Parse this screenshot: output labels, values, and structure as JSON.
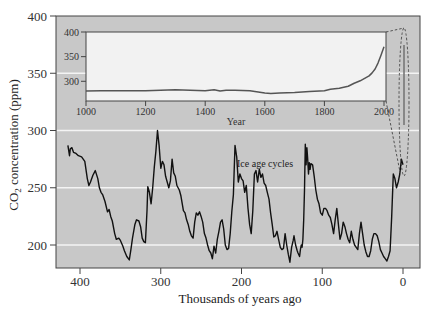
{
  "chart_data": [
    {
      "id": "main",
      "type": "line",
      "title": "",
      "xlabel": "Thousands of years ago",
      "ylabel": "CO2 concentration (ppm)",
      "ylabel_main": "CO",
      "ylabel_sub": "2",
      "ylabel_rest": " concentration (ppm)",
      "xlim": [
        420,
        -15
      ],
      "ylim": [
        180,
        400
      ],
      "x_reversed": true,
      "x_ticks": [
        400,
        300,
        200,
        100,
        0
      ],
      "x_tick_labels": [
        "400",
        "300",
        "200",
        "100",
        "0"
      ],
      "y_ticks": [
        200,
        250,
        300,
        350,
        400
      ],
      "y_tick_labels": [
        "200",
        "250",
        "300",
        "350",
        "400"
      ],
      "grid": "horizontal white lines at 200, 250, 300, 350",
      "background": "#c8c8c8",
      "annotation": "Ice age cycles",
      "series": [
        {
          "name": "Ice core CO2",
          "color": "#111111",
          "x": [
            415,
            413,
            412,
            410,
            408,
            405,
            402,
            398,
            394,
            391,
            389,
            387,
            384,
            381,
            378,
            376,
            374,
            372,
            369,
            366,
            364,
            362,
            360,
            357,
            355,
            352,
            350,
            347,
            345,
            342,
            339,
            337,
            335,
            332,
            330,
            327,
            325,
            323,
            321,
            319,
            317,
            316,
            314,
            312,
            310,
            308,
            306,
            304,
            302,
            300,
            298,
            296,
            294,
            292,
            290,
            288,
            286,
            284,
            282,
            280,
            277,
            275,
            272,
            270,
            268,
            266,
            264,
            262,
            260,
            258,
            256,
            254,
            252,
            250,
            248,
            246,
            244,
            242,
            240,
            238,
            236,
            234,
            232,
            230,
            228,
            226,
            224,
            222,
            220,
            218,
            216,
            214,
            212,
            210,
            208,
            206,
            204,
            202,
            200,
            198,
            196,
            194,
            192,
            190,
            188,
            186,
            184,
            182,
            180,
            178,
            176,
            174,
            172,
            170,
            168,
            166,
            164,
            162,
            160,
            158,
            156,
            154,
            152,
            150,
            148,
            146,
            144,
            142,
            140,
            138,
            136,
            135,
            133,
            131,
            130,
            128,
            127,
            126,
            125,
            124,
            123,
            122,
            121,
            120,
            119,
            118,
            117,
            116,
            115,
            114,
            112,
            110,
            108,
            106,
            104,
            102,
            100,
            98,
            96,
            94,
            92,
            90,
            88,
            86,
            84,
            82,
            80,
            78,
            76,
            74,
            72,
            70,
            68,
            66,
            64,
            62,
            60,
            58,
            56,
            54,
            52,
            50,
            48,
            46,
            44,
            42,
            40,
            38,
            36,
            34,
            32,
            30,
            28,
            26,
            24,
            22,
            20,
            18,
            16,
            14,
            12,
            10,
            8,
            6,
            4,
            2,
            0
          ],
          "y": [
            287,
            278,
            284,
            285,
            281,
            280,
            278,
            277,
            273,
            258,
            252,
            255,
            261,
            265,
            258,
            250,
            246,
            244,
            238,
            229,
            231,
            225,
            221,
            210,
            205,
            206,
            204,
            199,
            195,
            190,
            187,
            196,
            206,
            218,
            222,
            221,
            216,
            206,
            203,
            202,
            230,
            251,
            246,
            236,
            250,
            268,
            282,
            300,
            287,
            267,
            273,
            270,
            260,
            255,
            250,
            256,
            275,
            263,
            260,
            252,
            248,
            243,
            230,
            228,
            222,
            218,
            212,
            208,
            206,
            220,
            228,
            226,
            229,
            225,
            220,
            210,
            206,
            200,
            195,
            193,
            188,
            199,
            193,
            205,
            212,
            220,
            222,
            214,
            200,
            196,
            197,
            210,
            229,
            244,
            287,
            277,
            255,
            262,
            258,
            256,
            246,
            252,
            232,
            218,
            210,
            230,
            262,
            265,
            255,
            266,
            259,
            262,
            254,
            252,
            246,
            240,
            228,
            218,
            207,
            208,
            212,
            205,
            198,
            196,
            197,
            210,
            200,
            192,
            185,
            198,
            204,
            208,
            200,
            195,
            193,
            190,
            196,
            200,
            198,
            205,
            222,
            248,
            288,
            270,
            285,
            275,
            262,
            272,
            266,
            271,
            270,
            260,
            248,
            240,
            236,
            228,
            226,
            232,
            232,
            230,
            226,
            224,
            218,
            210,
            222,
            232,
            218,
            205,
            210,
            220,
            216,
            210,
            205,
            202,
            212,
            205,
            200,
            198,
            196,
            210,
            220,
            210,
            200,
            194,
            190,
            190,
            195,
            205,
            210,
            210,
            208,
            203,
            196,
            193,
            190,
            188,
            186,
            190,
            195,
            225,
            262,
            258,
            250,
            255,
            262,
            275,
            270,
            280
          ]
        },
        {
          "name": "Modern CO2 (last ~1 kyr)",
          "color": "#777777",
          "x": [
            0.6,
            0.4,
            0.2,
            0.05,
            0
          ],
          "y": [
            280,
            285,
            300,
            340,
            375
          ]
        }
      ]
    },
    {
      "id": "inset",
      "type": "line",
      "title": "",
      "xlabel": "Year",
      "ylabel": "",
      "xlim": [
        1000,
        2010
      ],
      "ylim": [
        260,
        400
      ],
      "x_ticks": [
        1000,
        1200,
        1400,
        1600,
        1800,
        2000
      ],
      "x_tick_labels": [
        "1000",
        "1200",
        "1400",
        "1600",
        "1800",
        "2000"
      ],
      "y_ticks": [
        300,
        350,
        400
      ],
      "y_tick_labels": [
        "300",
        "350",
        "400"
      ],
      "background": "#f2f2f2",
      "series": [
        {
          "name": "CO2 last millennium",
          "color": "#555555",
          "x": [
            1000,
            1050,
            1100,
            1150,
            1200,
            1250,
            1300,
            1350,
            1400,
            1430,
            1450,
            1470,
            1500,
            1550,
            1600,
            1620,
            1650,
            1700,
            1750,
            1800,
            1820,
            1850,
            1880,
            1900,
            1920,
            1950,
            1960,
            1970,
            1980,
            1990,
            2000
          ],
          "y": [
            280,
            281,
            281,
            281,
            281,
            282,
            283,
            282,
            281,
            283,
            280,
            282,
            282,
            281,
            276,
            275,
            276,
            277,
            279,
            281,
            284,
            286,
            290,
            296,
            301,
            311,
            317,
            325,
            337,
            353,
            370
          ]
        }
      ]
    }
  ],
  "main": {
    "x_axis_title": "Thousands of years ago",
    "y_axis_title_main": "CO",
    "y_axis_title_sub": "2",
    "y_axis_title_rest": " concentration (ppm)",
    "annotation": "Ice age cycles"
  },
  "inset": {
    "x_axis_title": "Year"
  }
}
